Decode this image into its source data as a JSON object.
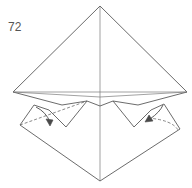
{
  "diagram": {
    "type": "origami-step",
    "step_number": "72",
    "colors": {
      "line": "#5a5a5a",
      "background": "#ffffff"
    },
    "elements": [
      "top-triangle-flap",
      "horizontal-base-crease",
      "vertical-center-crease",
      "w-shaped-folded-edge",
      "left-flap-with-fold-arrow",
      "right-flap-with-fold-arrow",
      "left-dashed-valley-fold",
      "right-dashed-valley-fold",
      "bottom-diamond-point"
    ]
  }
}
